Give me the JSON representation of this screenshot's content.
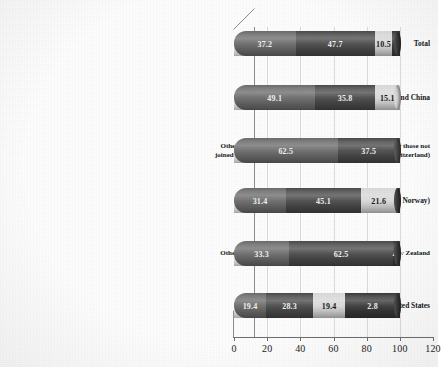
{
  "chart_data": {
    "type": "bar",
    "orientation": "horizontal",
    "stacked": true,
    "title": "",
    "xlabel": "",
    "ylabel": "",
    "xlim": [
      0,
      120
    ],
    "xticks": [
      "0",
      "20",
      "40",
      "60",
      "80",
      "100",
      "120"
    ],
    "grid": true,
    "legend": "none",
    "categories": [
      "Total",
      "G-77 and China",
      "Other Developed (includes the Russian Federation and other those not joined the Group of 77 as well as South Korea, Mexico and Switzerland)",
      "European Union (except Norway)",
      "Other JCANNZ: Japan, Canada, Australia, Norway and New Zealand",
      "United States"
    ],
    "series": [
      {
        "name": "segment-1",
        "color": "#6b6b6b",
        "values": [
          37.2,
          49.1,
          62.5,
          31.4,
          33.3,
          19.4
        ]
      },
      {
        "name": "segment-2",
        "color": "#4a4a4a",
        "values": [
          47.7,
          35.8,
          37.5,
          45.1,
          62.5,
          28.3
        ]
      },
      {
        "name": "segment-3",
        "color": "#d9d9d9",
        "values": [
          10.5,
          15.1,
          0.0,
          21.6,
          0.0,
          19.4
        ]
      },
      {
        "name": "segment-4",
        "color": "#3a3a3a",
        "values": [
          4.6,
          0.0,
          0.0,
          1.9,
          4.2,
          32.9
        ]
      }
    ],
    "bar_labels": [
      [
        "37.2",
        "47.7",
        "10.5",
        ""
      ],
      [
        "49.1",
        "35.8",
        "15.1",
        ""
      ],
      [
        "62.5",
        "37.5",
        "",
        ""
      ],
      [
        "31.4",
        "45.1",
        "21.6",
        ""
      ],
      [
        "33.3",
        "62.5",
        "",
        "4.2"
      ],
      [
        "19.4",
        "28.3",
        "19.4",
        "2.8"
      ]
    ]
  },
  "caption": {
    "text": ""
  }
}
